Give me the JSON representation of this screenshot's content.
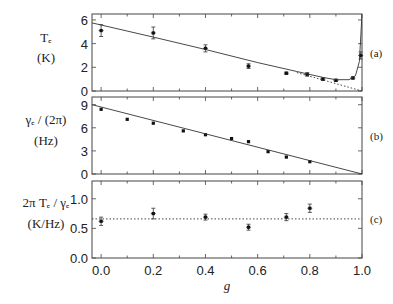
{
  "chart_data": [
    {
      "type": "scatter",
      "panel": "(a)",
      "ylabel": "T_e (K)",
      "ylabel_lines": [
        "Tₑ",
        "(K)"
      ],
      "xlabel": "g",
      "ylim": [
        0,
        6.5
      ],
      "yticks": [
        0,
        2,
        4,
        6
      ],
      "xlim": [
        -0.035,
        1.0
      ],
      "grid": false,
      "series": [
        {
          "name": "measured",
          "style": "points-with-errorbars",
          "x": [
            0.0,
            0.2,
            0.4,
            0.565,
            0.71,
            0.79,
            0.85,
            0.9,
            0.965,
            0.995
          ],
          "y": [
            5.1,
            4.9,
            3.6,
            2.1,
            1.5,
            1.4,
            1.0,
            0.9,
            1.1,
            3.0
          ],
          "yerr": [
            0.5,
            0.5,
            0.3,
            0.2,
            0.1,
            0.15,
            0.1,
            0.1,
            0.1,
            0.3
          ]
        },
        {
          "name": "model (solid)",
          "style": "solid-line",
          "x": [
            -0.035,
            0.2,
            0.4,
            0.6,
            0.75,
            0.85,
            0.9,
            0.95,
            0.975,
            0.99,
            1.0
          ],
          "y": [
            5.75,
            4.55,
            3.5,
            2.4,
            1.65,
            1.15,
            0.95,
            0.95,
            1.3,
            2.5,
            6.5
          ]
        },
        {
          "name": "linear (dotted)",
          "style": "dotted-line",
          "x": [
            0.75,
            1.0
          ],
          "y": [
            1.55,
            0.0
          ]
        }
      ]
    },
    {
      "type": "scatter",
      "panel": "(b)",
      "ylabel": "γ_e/(2π) (Hz)",
      "ylabel_lines": [
        "γₑ / (2π)",
        "(Hz)"
      ],
      "xlabel": "g",
      "ylim": [
        0,
        10
      ],
      "yticks": [
        0,
        3,
        6,
        9
      ],
      "xlim": [
        -0.035,
        1.0
      ],
      "grid": false,
      "series": [
        {
          "name": "measured",
          "style": "points",
          "x": [
            0.0,
            0.1,
            0.2,
            0.315,
            0.4,
            0.5,
            0.565,
            0.64,
            0.71,
            0.8
          ],
          "y": [
            8.4,
            7.1,
            6.6,
            5.6,
            5.1,
            4.6,
            4.2,
            2.9,
            2.2,
            1.6
          ]
        },
        {
          "name": "linear fit",
          "style": "solid-line",
          "x": [
            -0.035,
            1.0
          ],
          "y": [
            9.0,
            0.0
          ]
        }
      ]
    },
    {
      "type": "scatter",
      "panel": "(c)",
      "ylabel": "2πT_e/γ_e (K/Hz)",
      "ylabel_lines": [
        "2π Tₑ / γₑ",
        "(K/Hz)"
      ],
      "xlabel": "g",
      "ylim": [
        0,
        1.3
      ],
      "yticks": [
        0.0,
        0.5,
        1.0
      ],
      "yticklabels": [
        "0.0",
        "0.5",
        "1.0"
      ],
      "xlim": [
        -0.035,
        1.0
      ],
      "xticks": [
        0.0,
        0.2,
        0.4,
        0.6,
        0.8,
        1.0
      ],
      "xticklabels": [
        "0.0",
        "0.2",
        "0.4",
        "0.6",
        "0.8",
        "1.0"
      ],
      "grid": false,
      "series": [
        {
          "name": "measured",
          "style": "points-with-errorbars",
          "x": [
            0.0,
            0.2,
            0.4,
            0.565,
            0.71,
            0.8
          ],
          "y": [
            0.62,
            0.75,
            0.69,
            0.52,
            0.69,
            0.84
          ],
          "yerr": [
            0.07,
            0.09,
            0.05,
            0.05,
            0.06,
            0.07
          ]
        },
        {
          "name": "mean",
          "style": "dotted-line",
          "x": [
            -0.035,
            1.0
          ],
          "y": [
            0.66,
            0.66
          ]
        }
      ]
    }
  ],
  "labels": {
    "panel_a_tag": "(a)",
    "panel_b_tag": "(b)",
    "panel_c_tag": "(c)",
    "xlabel": "g"
  }
}
